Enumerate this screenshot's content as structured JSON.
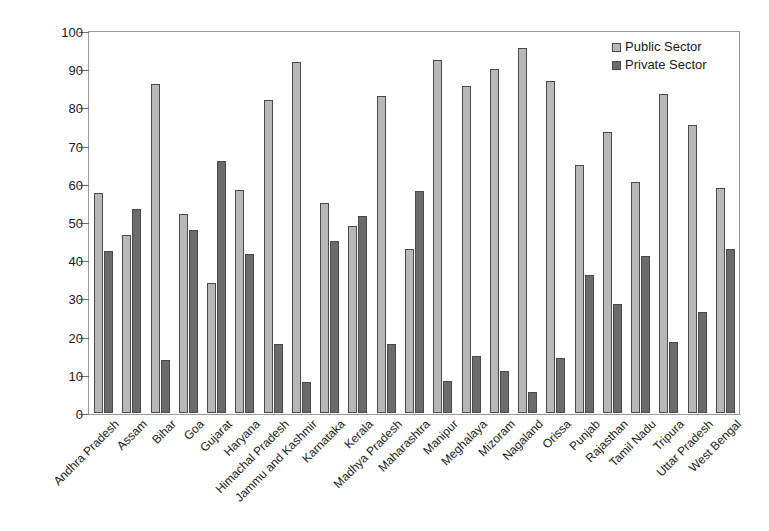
{
  "chart_data": {
    "type": "bar",
    "title": "",
    "xlabel": "",
    "ylabel": "Percentage of Employment",
    "ylim": [
      0,
      100
    ],
    "ytick_step": 10,
    "yticks": [
      0,
      10,
      20,
      30,
      40,
      50,
      60,
      70,
      80,
      90,
      100
    ],
    "grid": false,
    "legend_position": "top-right",
    "categories": [
      "Andhra Pradesh",
      "Assam",
      "Bihar",
      "Goa",
      "Gujarat",
      "Haryana",
      "Himachal Pradesh",
      "Jammu and Kashmir",
      "Karnataka",
      "Kerala",
      "Madhya Pradesh",
      "Maharashtra",
      "Manipur",
      "Meghalaya",
      "Mizoram",
      "Nagaland",
      "Orissa",
      "Punjab",
      "Rajasthan",
      "Tamil Nadu",
      "Tripura",
      "Uttar Pradesh",
      "West Bengal"
    ],
    "series": [
      {
        "name": "Public Sector",
        "color": "#b8b8b8",
        "values": [
          57.5,
          46.5,
          86.0,
          52.0,
          34.0,
          58.5,
          82.0,
          92.0,
          55.0,
          49.0,
          83.0,
          43.0,
          92.5,
          85.5,
          90.0,
          95.5,
          87.0,
          65.0,
          73.5,
          60.5,
          83.5,
          75.5,
          59.0
        ]
      },
      {
        "name": "Private Sector",
        "color": "#6b6b6b",
        "values": [
          42.5,
          53.5,
          14.0,
          48.0,
          66.0,
          41.5,
          18.0,
          8.0,
          45.0,
          51.5,
          18.0,
          58.0,
          8.5,
          15.0,
          11.0,
          5.5,
          14.5,
          36.0,
          28.5,
          41.0,
          18.5,
          26.5,
          43.0
        ]
      }
    ]
  },
  "legend": {
    "items": [
      {
        "label": "Public Sector",
        "color": "#b8b8b8"
      },
      {
        "label": "Private Sector",
        "color": "#6b6b6b"
      }
    ]
  },
  "axis": {
    "y_title": "Percentage of Employment"
  }
}
